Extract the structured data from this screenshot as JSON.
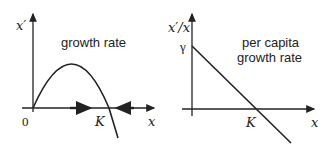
{
  "left_panel": {
    "y_label": "x′",
    "x_label": "x",
    "origin_label": "0",
    "k_label": "K",
    "title": "growth rate"
  },
  "right_panel": {
    "y_label": "x′/x",
    "x_label": "x",
    "k_label": "K",
    "gamma_label": "γ",
    "title_line1": "per capita",
    "title_line2": "growth rate"
  }
}
